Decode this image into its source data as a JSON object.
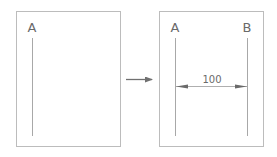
{
  "before_panel": {
    "label_a": "A"
  },
  "transition_arrow": {
    "icon": "right-arrow-icon"
  },
  "after_panel": {
    "label_a": "A",
    "label_b": "B",
    "dimension_value": "100"
  },
  "colors": {
    "frame": "#b8b8b8",
    "line": "#a8a8a8",
    "text": "#6a6a6a",
    "arrow": "#707070"
  }
}
